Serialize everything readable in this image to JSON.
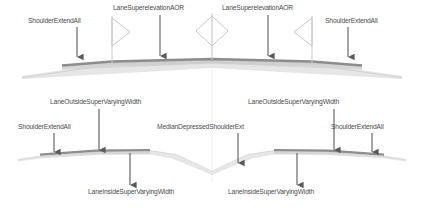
{
  "diagram": {
    "colors": {
      "label_text": "#4a4a4a",
      "arrow": "#5a5a5a",
      "pavement_top": "#8d8d8d",
      "pavement_fill": "#cfcfcf",
      "shoulder_fill": "#e2e2e2",
      "marker_outline": "#c8c8c8",
      "centerline": "#ededed",
      "background": "#ffffff"
    }
  },
  "top_section": {
    "name": "undivided-crown-section",
    "markers": [
      {
        "name": "flag-marker-left",
        "type": "flag",
        "x": 112,
        "facing": "right"
      },
      {
        "name": "diamond-marker-center",
        "type": "diamond",
        "x": 212
      },
      {
        "name": "flag-marker-right",
        "type": "flag",
        "x": 312,
        "facing": "left"
      }
    ],
    "labels": [
      {
        "name": "label-shoulder-extend-all-left",
        "text": "ShoulderExtendAll",
        "x": 28,
        "y": 17,
        "arrow_x": 77,
        "arrow_top": 27,
        "arrow_bottom": 57
      },
      {
        "name": "label-lane-superelevation-aor-left",
        "text": "LaneSuperelevationAOR",
        "x": 113,
        "y": 4,
        "arrow_x": 160,
        "arrow_top": 15,
        "arrow_bottom": 56
      },
      {
        "name": "label-lane-superelevation-aor-right",
        "text": "LaneSuperelevationAOR",
        "x": 222,
        "y": 4,
        "arrow_x": 268,
        "arrow_top": 15,
        "arrow_bottom": 56
      },
      {
        "name": "label-shoulder-extend-all-right",
        "text": "ShoulderExtendAll",
        "x": 325,
        "y": 17,
        "arrow_x": 348,
        "arrow_top": 27,
        "arrow_bottom": 57
      }
    ]
  },
  "bottom_section": {
    "name": "divided-depressed-median-section",
    "labels": [
      {
        "name": "label-lane-outside-super-varying-width-left",
        "text": "LaneOutsideSuperVaryingWidth",
        "x": 50,
        "y": 98,
        "arrow_x": 99,
        "arrow_top": 109,
        "arrow_bottom": 150
      },
      {
        "name": "label-shoulder-extend-all-bottom-left",
        "text": "ShoulderExtendAll",
        "x": 18,
        "y": 123,
        "arrow_x": 54,
        "arrow_top": 133,
        "arrow_bottom": 152
      },
      {
        "name": "label-median-depressed-shoulder-ext",
        "text": "MedianDepressedShoulderExt",
        "x": 157,
        "y": 123,
        "arrow_x": 238,
        "arrow_top": 133,
        "arrow_bottom": 163
      },
      {
        "name": "label-lane-outside-super-varying-width-right",
        "text": "LaneOutsideSuperVaryingWidth",
        "x": 248,
        "y": 98,
        "arrow_x": 334,
        "arrow_top": 109,
        "arrow_bottom": 150
      },
      {
        "name": "label-shoulder-extend-all-bottom-right",
        "text": "ShoulderExtendAll",
        "x": 331,
        "y": 123,
        "arrow_x": 372,
        "arrow_top": 133,
        "arrow_bottom": 152
      },
      {
        "name": "label-lane-inside-super-varying-width-left",
        "text": "LaneInsideSuperVaryingWidth",
        "x": 88,
        "y": 188,
        "arrow_x": 130,
        "arrow_top": 153,
        "arrow_bottom": 185
      },
      {
        "name": "label-lane-inside-super-varying-width-right",
        "text": "LaneInsideSuperVaryingWidth",
        "x": 228,
        "y": 188,
        "arrow_x": 297,
        "arrow_top": 153,
        "arrow_bottom": 185
      }
    ]
  }
}
